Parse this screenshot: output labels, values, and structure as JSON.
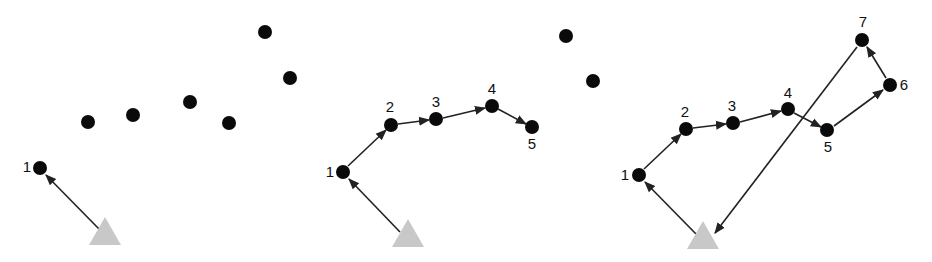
{
  "diagram": {
    "colors": {
      "dot": "#0a0a0a",
      "depot": "#c8c8c8",
      "arrow": "#222222",
      "label": "#111111"
    },
    "panels": [
      {
        "id": "panel-1",
        "depot": {
          "x": 105,
          "y": 238
        },
        "dots": [
          {
            "x": 40,
            "y": 168,
            "label": "1",
            "lx": 27,
            "ly": 172
          },
          {
            "x": 88,
            "y": 122,
            "label": ""
          },
          {
            "x": 133,
            "y": 115,
            "label": ""
          },
          {
            "x": 190,
            "y": 102,
            "label": ""
          },
          {
            "x": 229,
            "y": 123,
            "label": ""
          },
          {
            "x": 265,
            "y": 32,
            "label": ""
          },
          {
            "x": 290,
            "y": 78,
            "label": ""
          }
        ],
        "edges": [
          {
            "from": [
              100,
              230
            ],
            "to": [
              46,
              175
            ]
          }
        ]
      },
      {
        "id": "panel-2",
        "depot": {
          "x": 408,
          "y": 240
        },
        "dots": [
          {
            "x": 343,
            "y": 172,
            "label": "1",
            "lx": 330,
            "ly": 177
          },
          {
            "x": 391,
            "y": 125,
            "label": "2",
            "lx": 390,
            "ly": 112
          },
          {
            "x": 436,
            "y": 119,
            "label": "3",
            "lx": 436,
            "ly": 107
          },
          {
            "x": 492,
            "y": 106,
            "label": "4",
            "lx": 492,
            "ly": 94
          },
          {
            "x": 532,
            "y": 127,
            "label": "5",
            "lx": 532,
            "ly": 149
          },
          {
            "x": 566,
            "y": 36,
            "label": ""
          },
          {
            "x": 593,
            "y": 81,
            "label": ""
          }
        ],
        "edges": [
          {
            "from": [
              400,
              232
            ],
            "to": [
              349,
              179
            ]
          },
          {
            "from": [
              348,
              166
            ],
            "to": [
              386,
              130
            ]
          },
          {
            "from": [
              398,
              124
            ],
            "to": [
              429,
              120
            ]
          },
          {
            "from": [
              443,
              118
            ],
            "to": [
              485,
              108
            ]
          },
          {
            "from": [
              498,
              109
            ],
            "to": [
              526,
              124
            ]
          }
        ]
      },
      {
        "id": "panel-3",
        "depot": {
          "x": 703,
          "y": 242
        },
        "dots": [
          {
            "x": 639,
            "y": 175,
            "label": "1",
            "lx": 625,
            "ly": 180
          },
          {
            "x": 686,
            "y": 129,
            "label": "2",
            "lx": 685,
            "ly": 117
          },
          {
            "x": 733,
            "y": 123,
            "label": "3",
            "lx": 732,
            "ly": 111
          },
          {
            "x": 788,
            "y": 109,
            "label": "4",
            "lx": 788,
            "ly": 98
          },
          {
            "x": 827,
            "y": 130,
            "label": "5",
            "lx": 828,
            "ly": 152
          },
          {
            "x": 890,
            "y": 85,
            "label": "6",
            "lx": 904,
            "ly": 90
          },
          {
            "x": 862,
            "y": 40,
            "label": "7",
            "lx": 863,
            "ly": 27
          }
        ],
        "edges": [
          {
            "from": [
              696,
              234
            ],
            "to": [
              645,
              182
            ]
          },
          {
            "from": [
              644,
              169
            ],
            "to": [
              681,
              134
            ]
          },
          {
            "from": [
              693,
              128
            ],
            "to": [
              726,
              124
            ]
          },
          {
            "from": [
              740,
              122
            ],
            "to": [
              781,
              111
            ]
          },
          {
            "from": [
              794,
              113
            ],
            "to": [
              821,
              127
            ]
          },
          {
            "from": [
              834,
              126
            ],
            "to": [
              883,
              90
            ]
          },
          {
            "from": [
              886,
              78
            ],
            "to": [
              867,
              47
            ]
          },
          {
            "from": [
              857,
              47
            ],
            "to": [
              715,
              233
            ]
          }
        ]
      }
    ]
  }
}
